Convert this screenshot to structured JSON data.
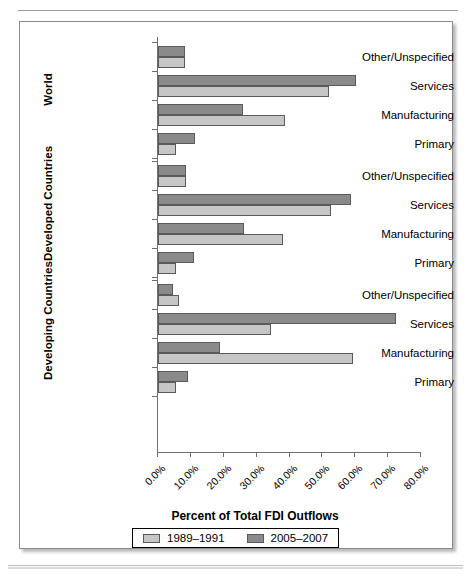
{
  "page": {
    "top_rule_ghost_text": "",
    "figure_border_color": "#8c8c8c"
  },
  "colors": {
    "series_1989_1991": "#c6c6c6",
    "series_2005_2007": "#8a8a8a",
    "axis": "#6f6f6f",
    "text": "#000000"
  },
  "chart_data": {
    "type": "bar",
    "orientation": "horizontal",
    "title": "",
    "xlabel": "Percent of Total FDI Outflows",
    "ylabel": "",
    "xlim": [
      0,
      80
    ],
    "xtick_labels": [
      "0.0%",
      "10.0%",
      "20.0%",
      "30.0%",
      "40.0%",
      "50.0%",
      "60.0%",
      "70.0%",
      "80.0%"
    ],
    "xticks": [
      0,
      10,
      20,
      30,
      40,
      50,
      60,
      70,
      80
    ],
    "grid": false,
    "legend_position": "bottom",
    "legend": [
      "1989–1991",
      "2005–2007"
    ],
    "categories": [
      "Primary",
      "Manufacturing",
      "Services",
      "Other/Unspecified"
    ],
    "groups": [
      {
        "name": "World",
        "categories": [
          "Other/Unspecified",
          "Services",
          "Manufacturing",
          "Primary"
        ],
        "series": [
          {
            "name": "1989–1991",
            "values": [
              8.3,
              51.9,
              38.6,
              5.5
            ]
          },
          {
            "name": "2005–2007",
            "values": [
              8.3,
              60.2,
              25.8,
              11.3
            ]
          }
        ]
      },
      {
        "name": "Developed Countries",
        "categories": [
          "Other/Unspecified",
          "Services",
          "Manufacturing",
          "Primary"
        ],
        "series": [
          {
            "name": "1989–1991",
            "values": [
              8.4,
              52.6,
              38.0,
              5.4
            ]
          },
          {
            "name": "2005–2007",
            "values": [
              8.4,
              58.8,
              26.3,
              11.0
            ]
          }
        ]
      },
      {
        "name": "Developing Countries",
        "categories": [
          "Other/Unspecified",
          "Services",
          "Manufacturing",
          "Primary"
        ],
        "series": [
          {
            "name": "1989–1991",
            "values": [
              6.5,
              34.4,
              59.4,
              5.5
            ]
          },
          {
            "name": "2005–2007",
            "values": [
              4.5,
              72.3,
              19.0,
              9.0
            ]
          }
        ]
      }
    ]
  }
}
